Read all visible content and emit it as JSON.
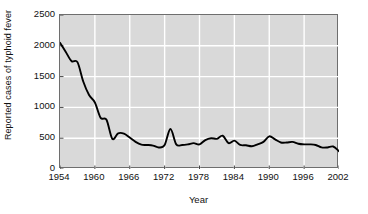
{
  "chart_data": {
    "type": "line",
    "title": "",
    "xlabel": "Year",
    "ylabel": "Reported cases of typhoid fever",
    "xlim": [
      1954,
      2002
    ],
    "ylim": [
      0,
      2500
    ],
    "grid": true,
    "legend": "none",
    "line_color": "#000000",
    "plot_background": "#d9d9d9",
    "gridline_color": "#ffffff",
    "axis_color": "#6e6e6e",
    "xticks": [
      1954,
      1960,
      1966,
      1972,
      1978,
      1984,
      1990,
      1996,
      2002
    ],
    "yticks": [
      0,
      500,
      1000,
      1500,
      2000,
      2500
    ],
    "xtick_labels": [
      "1954",
      "1960",
      "1966",
      "1972",
      "1978",
      "1984",
      "1990",
      "1996",
      "2002"
    ],
    "ytick_labels": [
      "0",
      "500",
      "1000",
      "1500",
      "2000",
      "2500"
    ],
    "series": [
      {
        "name": "Reported cases of typhoid fever",
        "x": [
          1954,
          1955,
          1956,
          1957,
          1958,
          1959,
          1960,
          1961,
          1962,
          1963,
          1964,
          1965,
          1966,
          1967,
          1968,
          1969,
          1970,
          1971,
          1972,
          1973,
          1974,
          1975,
          1976,
          1977,
          1978,
          1979,
          1980,
          1981,
          1982,
          1983,
          1984,
          1985,
          1986,
          1987,
          1988,
          1989,
          1990,
          1991,
          1992,
          1993,
          1994,
          1995,
          1996,
          1997,
          1998,
          1999,
          2000,
          2001,
          2002
        ],
        "values": [
          2050,
          1900,
          1750,
          1735,
          1420,
          1200,
          1080,
          830,
          800,
          490,
          580,
          575,
          510,
          440,
          395,
          390,
          380,
          350,
          390,
          650,
          400,
          390,
          400,
          420,
          400,
          470,
          500,
          490,
          540,
          420,
          460,
          390,
          385,
          370,
          400,
          440,
          530,
          480,
          430,
          430,
          440,
          410,
          400,
          400,
          390,
          350,
          350,
          365,
          290
        ]
      }
    ]
  }
}
